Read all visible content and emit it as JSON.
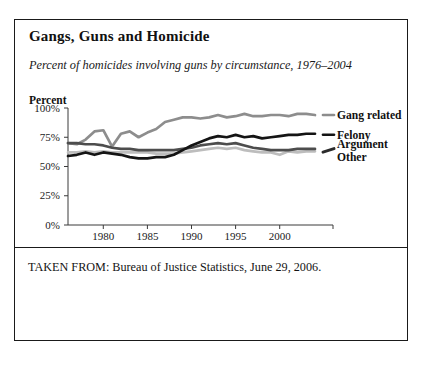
{
  "figure": {
    "title": "Gangs, Guns and Homicide",
    "subtitle": "Percent of homicides involving guns by circumstance, 1976–2004",
    "axis_title": "Percent",
    "footer": "TAKEN FROM: Bureau of Justice Statistics, June 29, 2006."
  },
  "chart_data": {
    "type": "line",
    "title": "Gangs, Guns and Homicide",
    "subtitle": "Percent of homicides involving guns by circumstance, 1976–2004",
    "xlabel": "",
    "ylabel": "Percent",
    "xlim": [
      1976,
      2004
    ],
    "ylim": [
      0,
      100
    ],
    "grid": false,
    "legend_position": "right",
    "ytick_labels": [
      "0%",
      "25%",
      "50%",
      "75%",
      "100%"
    ],
    "ytick_values": [
      0,
      25,
      50,
      75,
      100
    ],
    "xtick_labels": [
      "1980",
      "1985",
      "1990",
      "1995",
      "2000"
    ],
    "xtick_values": [
      1980,
      1985,
      1990,
      1995,
      2000
    ],
    "x": [
      1976,
      1977,
      1978,
      1979,
      1980,
      1981,
      1982,
      1983,
      1984,
      1985,
      1986,
      1987,
      1988,
      1989,
      1990,
      1991,
      1992,
      1993,
      1994,
      1995,
      1996,
      1997,
      1998,
      1999,
      2000,
      2001,
      2002,
      2003,
      2004
    ],
    "series": [
      {
        "name": "Gang related",
        "color": "#8d8d8d",
        "values": [
          70,
          69,
          73,
          80,
          81,
          67,
          78,
          80,
          75,
          79,
          82,
          88,
          90,
          92,
          92,
          91,
          92,
          94,
          92,
          93,
          95,
          93,
          93,
          94,
          94,
          93,
          95,
          95,
          94
        ]
      },
      {
        "name": "Felony",
        "color": "#141414",
        "values": [
          59,
          60,
          62,
          60,
          62,
          61,
          60,
          58,
          57,
          57,
          58,
          58,
          60,
          64,
          68,
          71,
          74,
          76,
          75,
          77,
          75,
          76,
          74,
          75,
          76,
          77,
          77,
          78,
          78
        ]
      },
      {
        "name": "Argument",
        "color": "#4d4d4d",
        "values": [
          70,
          70,
          69,
          69,
          68,
          66,
          65,
          65,
          64,
          64,
          64,
          64,
          64,
          65,
          66,
          68,
          69,
          70,
          69,
          70,
          68,
          66,
          65,
          64,
          64,
          64,
          65,
          65,
          65
        ]
      },
      {
        "name": "Other",
        "color": "#bdbdbd",
        "values": [
          62,
          62,
          63,
          62,
          63,
          62,
          62,
          62,
          62,
          62,
          61,
          61,
          61,
          62,
          63,
          64,
          65,
          66,
          65,
          66,
          64,
          63,
          62,
          62,
          60,
          63,
          62,
          63,
          63
        ]
      }
    ],
    "legend_entries": [
      {
        "label": "Gang related",
        "color": "#8d8d8d"
      },
      {
        "label": "Felony",
        "color": "#141414"
      },
      {
        "label": "Argument",
        "color": "#4d4d4d"
      },
      {
        "label": "Other",
        "color": "#bdbdbd"
      }
    ]
  }
}
